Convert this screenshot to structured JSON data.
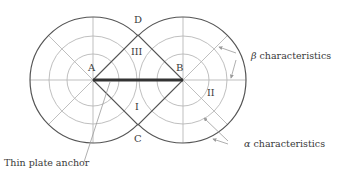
{
  "diagram": {
    "points": {
      "A": "A",
      "B": "B",
      "C": "C",
      "D": "D"
    },
    "regions": {
      "I": "I",
      "II": "II",
      "III": "III"
    },
    "annotations": {
      "beta_symbol": "β",
      "beta_text": " characteristics",
      "alpha_symbol": "α",
      "alpha_text": " characteristics",
      "anchor": "Thin plate anchor"
    },
    "colors": {
      "outer_circle": "#555555",
      "grid_lines": "#b8b8b8",
      "boundary": "#555555",
      "anchor_plate": "#333333",
      "leader": "#9a9a9a",
      "text": "#3a3a3a"
    }
  }
}
